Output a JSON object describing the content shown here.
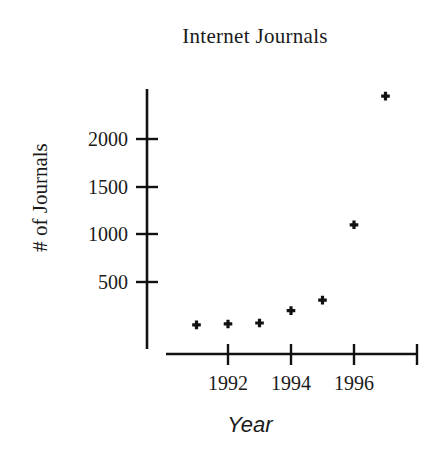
{
  "chart_data": {
    "type": "scatter",
    "title": "Internet Journals",
    "xlabel": "Year",
    "ylabel": "# of Journals",
    "x": [
      1991,
      1992,
      1993,
      1994,
      1995,
      1996,
      1997
    ],
    "values": [
      50,
      60,
      70,
      200,
      310,
      1100,
      2450
    ],
    "series": [
      {
        "name": "# of Journals",
        "values": [
          50,
          60,
          70,
          200,
          310,
          1100,
          2450
        ]
      }
    ],
    "xlim": [
      1990.5,
      1997.5
    ],
    "ylim": [
      0,
      2600
    ],
    "xticks": [
      1992,
      1994,
      1996
    ],
    "xtick_labels": [
      "1992",
      "1994",
      "1996"
    ],
    "yticks": [
      500,
      1000,
      1500,
      2000
    ],
    "ytick_labels": [
      "500",
      "1000",
      "1500",
      "2000"
    ],
    "grid": false,
    "legend": "none",
    "marker": "plus",
    "marker_color": "#111111"
  },
  "axis": {
    "y_labels": [
      "2000",
      "1500",
      "1000",
      "500"
    ],
    "x_labels": [
      "1992",
      "1994",
      "1996"
    ]
  },
  "colors": {
    "background": "#ffffff",
    "ink": "#111111"
  }
}
